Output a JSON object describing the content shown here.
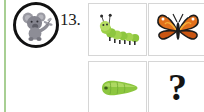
{
  "page": {
    "background_color": "#ffffff",
    "edge_rule_color": "#a8cf93"
  },
  "question": {
    "number_label": "13.",
    "badge": {
      "icon_name": "koala-icon",
      "outline_color": "#111111",
      "fill_color": "#8b8b93"
    }
  },
  "picture_grid": {
    "border_color": "#d6d6d6",
    "rows": [
      {
        "cells": [
          {
            "icon_name": "caterpillar-icon",
            "label": "caterpillar",
            "color": "#7dc242"
          },
          {
            "icon_name": "butterfly-icon",
            "label": "butterfly",
            "color": "#e2701c"
          }
        ]
      },
      {
        "cells": [
          {
            "icon_name": "larva-icon",
            "label": "larva",
            "color": "#8cc63f"
          },
          {
            "icon_name": "question-mark-icon",
            "label": "?",
            "color": "#141414"
          }
        ]
      }
    ]
  }
}
